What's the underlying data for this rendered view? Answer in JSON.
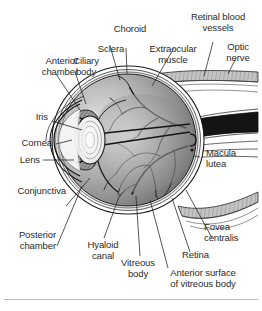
{
  "figure": {
    "background_color": "#ffffff",
    "text_color": "#2b2b2b",
    "rule_color": "#b9b9b9"
  },
  "labels": {
    "anterior_chamber": "Anterior\nchamber",
    "ciliary_body": "Ciliary\nbody",
    "sclera": "Sclera",
    "choroid": "Choroid",
    "extraocular_muscle": "Extraocular\nmuscle",
    "retinal_blood_vessels": "Retinal blood\nvessels",
    "optic_nerve": "Optic\nnerve",
    "iris": "Iris",
    "cornea": "Cornea",
    "lens": "Lens",
    "conjunctiva": "Conjunctiva",
    "posterior_chamber": "Posterior\nchamber",
    "hyaloid_canal": "Hyaloid\ncanal",
    "vitreous_body": "Vitreous\nbody",
    "macula_lutea": "Macula\nlutea",
    "fovea_centralis": "Fovea\ncentralis",
    "retina": "Retina",
    "anterior_surface_of_vitreous_body": "Anterior surface\nof vitreous body"
  },
  "structures": {
    "globe_fill_light": "#d8d8d8",
    "globe_fill_dark": "#6f6f6f",
    "sclera_stroke": "#1a1a1a",
    "vessel_stroke": "#1a1a1a",
    "muscle_fill": "#c9c9c9",
    "lens_fill": "#f2f2f2",
    "cornea_fill": "#bdbdbd",
    "nerve_fill": "#1a1a1a",
    "leader_stroke": "#2b2b2b"
  }
}
